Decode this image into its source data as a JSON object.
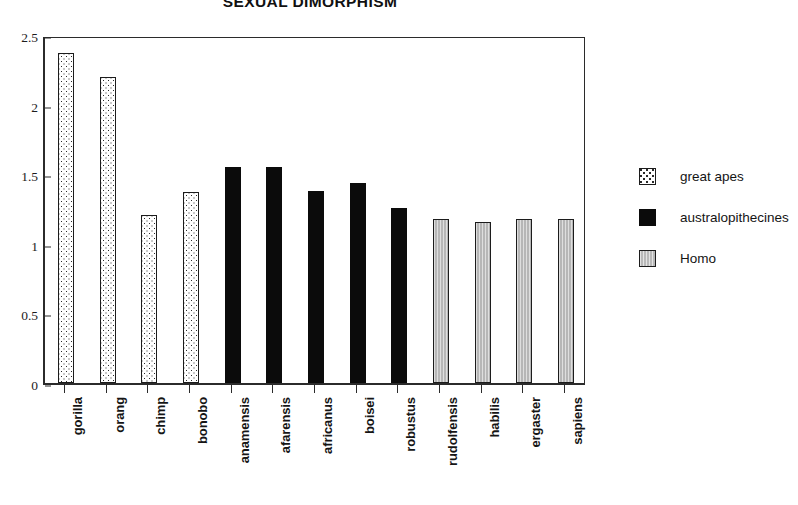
{
  "chart_data": {
    "type": "bar",
    "title": "SEXUAL DIMORPHISM",
    "xlabel": "",
    "ylabel": "",
    "ylim": [
      0,
      2.5
    ],
    "ytick_labels": [
      "0",
      "0.5",
      "1",
      "1.5",
      "2",
      "2.5"
    ],
    "ytick_values": [
      0,
      0.5,
      1,
      1.5,
      2,
      2.5
    ],
    "grid": false,
    "legend_position": "right",
    "categories": [
      "gorilla",
      "orang",
      "chimp",
      "bonobo",
      "anamensis",
      "afarensis",
      "africanus",
      "boisei",
      "robustus",
      "rudolfensis",
      "habilis",
      "ergaster",
      "sapiens"
    ],
    "values": [
      2.37,
      2.2,
      1.21,
      1.37,
      1.55,
      1.55,
      1.38,
      1.44,
      1.26,
      1.18,
      1.16,
      1.18,
      1.18
    ],
    "groups": [
      "great apes",
      "great apes",
      "great apes",
      "great apes",
      "australopithecines",
      "australopithecines",
      "australopithecines",
      "australopithecines",
      "australopithecines",
      "Homo",
      "Homo",
      "Homo",
      "Homo"
    ],
    "series": [
      {
        "name": "great apes",
        "fill": "dotted",
        "points": [
          {
            "category": "gorilla",
            "value": 2.37
          },
          {
            "category": "orang",
            "value": 2.2
          },
          {
            "category": "chimp",
            "value": 1.21
          },
          {
            "category": "bonobo",
            "value": 1.37
          }
        ]
      },
      {
        "name": "australopithecines",
        "fill": "solid-black",
        "points": [
          {
            "category": "anamensis",
            "value": 1.55
          },
          {
            "category": "afarensis",
            "value": 1.55
          },
          {
            "category": "africanus",
            "value": 1.38
          },
          {
            "category": "boisei",
            "value": 1.44
          },
          {
            "category": "robustus",
            "value": 1.26
          }
        ]
      },
      {
        "name": "Homo",
        "fill": "gray",
        "points": [
          {
            "category": "rudolfensis",
            "value": 1.18
          },
          {
            "category": "habilis",
            "value": 1.16
          },
          {
            "category": "ergaster",
            "value": 1.18
          },
          {
            "category": "sapiens",
            "value": 1.18
          }
        ]
      }
    ]
  },
  "legend": {
    "items": [
      {
        "label": "great apes",
        "style": "greatapes"
      },
      {
        "label": "australopithecines",
        "style": "australo"
      },
      {
        "label": "Homo",
        "style": "homo"
      }
    ]
  },
  "colors": {
    "axis": "#2b2b2b",
    "bar_outline": "#1c1c1c",
    "australopithecines_fill": "#0b0b0b",
    "homo_fill": "#b6b6b6",
    "great_apes_fill": "#ffffff",
    "text": "#1a1a1a",
    "background": "#ffffff"
  }
}
